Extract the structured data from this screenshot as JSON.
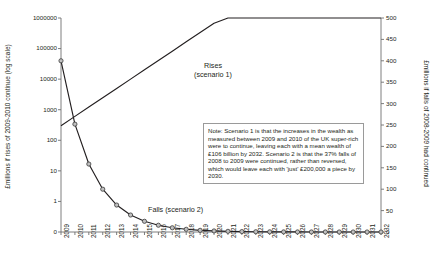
{
  "chart_data": {
    "type": "line",
    "title": "",
    "xlabel": "",
    "ylabel": "£millions if rises of 2009-2010 continue (log scale)",
    "y2label": "£millions if falls of 2008-2009 had continued",
    "grid": false,
    "legend_position": "inline-annotation",
    "yscale": "log",
    "ylim": [
      0,
      1000000
    ],
    "y2lim": [
      0,
      500
    ],
    "categories": [
      "2009",
      "2010",
      "2011",
      "2012",
      "2013",
      "2014",
      "2015",
      "2016",
      "2017",
      "2018",
      "2019",
      "2020",
      "2021",
      "2022",
      "2023",
      "2024",
      "2025",
      "2026",
      "2027",
      "2028",
      "2029",
      "2030",
      "2031",
      "2032"
    ],
    "yticks": [
      "1000000",
      "100000",
      "10000",
      "1000",
      "100",
      "10",
      "1",
      "0"
    ],
    "y2ticks": [
      "500",
      "450",
      "400",
      "350",
      "300",
      "250",
      "200",
      "150",
      "100",
      "50",
      "0"
    ],
    "series": [
      {
        "name": "Rises (scenario 1)",
        "axis": "left",
        "marker": "none",
        "values": [
          300,
          605,
          1221,
          2463,
          4969,
          10026,
          20226,
          40805,
          82321,
          166080,
          335051,
          675938,
          1363700,
          2751000,
          5550000,
          11197000,
          22588000,
          45567000,
          91920000,
          185440000,
          374090000,
          754700000,
          1522500000,
          3071400000
        ]
      },
      {
        "name": "Falls (scenario 2)",
        "axis": "right",
        "marker": "circle",
        "values": [
          400.0,
          252.0,
          158.8,
          100.0,
          63.0,
          39.7,
          25.0,
          15.8,
          9.9,
          6.3,
          3.9,
          2.5,
          1.6,
          1.0,
          0.6,
          0.4,
          0.25,
          0.15,
          0.1,
          0.06,
          0.04,
          0.02,
          0.015,
          0.01
        ]
      }
    ],
    "annotations": [
      {
        "name": "rises-label",
        "text_line_1": "Rises",
        "text_line_2": "(scenario 1)"
      },
      {
        "name": "falls-label",
        "text": "Falls (scenario 2)"
      },
      {
        "name": "note-box",
        "text": "Note: Scenario 1 is that the increases in the wealth as measured between 2009 and 2010 of the UK super-rich were to continue, leaving each with a mean wealth of £106 billion by 2032. Scenario 2 is that the 37% falls of 2008 to 2009 were continued, rather than reversed, which would leave each with 'just' £200,000 a piece by 2030."
      }
    ],
    "colors": {
      "line": "#231f20",
      "marker_fill": "#bfbfbf",
      "marker_stroke": "#3a3a3a",
      "axis": "#6f6f6f",
      "text": "#231f20",
      "note_border": "#9a9a9a",
      "background": "#ffffff"
    }
  }
}
